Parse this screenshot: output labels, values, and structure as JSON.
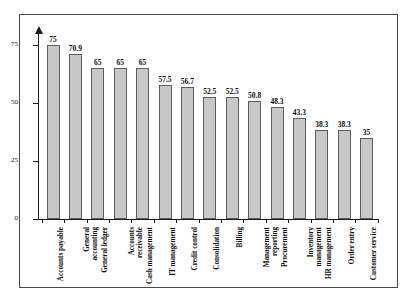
{
  "chart_data": {
    "type": "bar",
    "title": "",
    "subtitle": "",
    "xlabel": "",
    "ylabel": "",
    "ylim": [
      0,
      80
    ],
    "yticks": [
      0,
      25,
      50,
      75
    ],
    "ytick_labels": [
      "0",
      "25",
      "50",
      "75"
    ],
    "grid": false,
    "legend": false,
    "orientation": "vertical",
    "value_labels_shown": true,
    "categories": [
      "Accounts payable",
      "General accounting",
      "General ledger",
      "Accounts receivable",
      "Cash management",
      "IT management",
      "Credit control",
      "Consolidation",
      "Billing",
      "Management reporting",
      "Procurement",
      "Inventory management",
      "HR management",
      "Order entry",
      "Customer service"
    ],
    "values": [
      75,
      70.9,
      65,
      65,
      65,
      57.5,
      56.7,
      52.5,
      52.5,
      50.8,
      48.3,
      43.3,
      38.3,
      38.3,
      35
    ],
    "value_labels": [
      "75",
      "70.9",
      "65",
      "65",
      "65",
      "57.5",
      "56.7",
      "52.5",
      "52.5",
      "50.8",
      "48.3",
      "43.3",
      "38.3",
      "38.3",
      "35"
    ],
    "bar_color": "#c8c8c8",
    "bar_edge_color": "#5d5d5d",
    "axis_color": "#1b1b1b",
    "frame_color": "#4a4a4a",
    "background_color": "#ffffff"
  }
}
